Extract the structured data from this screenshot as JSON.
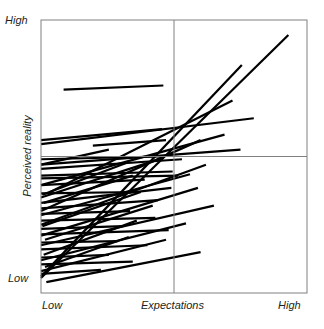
{
  "chart_data": {
    "type": "scatter",
    "title": "",
    "subtitle": "",
    "xlabel": "Expectations",
    "ylabel": "Perceived reality",
    "xlim": [
      0,
      1
    ],
    "ylim": [
      0,
      1
    ],
    "grid": false,
    "legend": false,
    "legend_position": "none",
    "xtick_labels": [
      "Low",
      "Expectations",
      "High"
    ],
    "ytick_labels": [
      "High",
      "Low"
    ],
    "x_axis_low_label": "Low",
    "x_axis_mid_label": "Expectations",
    "x_axis_high_label": "High",
    "y_axis_high_label": "High",
    "y_axis_low_label": "Low",
    "midline_x": 0.5,
    "midline_y": 0.5,
    "stroke_color": "#000000",
    "frame_color": "#808080",
    "midline_color": "#808080",
    "background_color": "#ffffff",
    "stroke_width": 2.2,
    "annotations": [],
    "segment_count": 42,
    "segments": [
      {
        "id": 1,
        "x1": 0.0,
        "y1": 0.055,
        "x2": 0.93,
        "y2": 0.945
      },
      {
        "id": 2,
        "x1": 0.0,
        "y1": 0.06,
        "x2": 0.755,
        "y2": 0.835
      },
      {
        "id": 3,
        "x1": 0.085,
        "y1": 0.745,
        "x2": 0.46,
        "y2": 0.76
      },
      {
        "id": 4,
        "x1": 0.0,
        "y1": 0.56,
        "x2": 0.455,
        "y2": 0.6
      },
      {
        "id": 5,
        "x1": 0.0,
        "y1": 0.49,
        "x2": 0.445,
        "y2": 0.5
      },
      {
        "id": 6,
        "x1": 0.035,
        "y1": 0.37,
        "x2": 0.72,
        "y2": 0.705
      },
      {
        "id": 7,
        "x1": 0.0,
        "y1": 0.395,
        "x2": 0.69,
        "y2": 0.58
      },
      {
        "id": 8,
        "x1": 0.0,
        "y1": 0.43,
        "x2": 0.495,
        "y2": 0.445
      },
      {
        "id": 9,
        "x1": 0.195,
        "y1": 0.54,
        "x2": 0.47,
        "y2": 0.56
      },
      {
        "id": 10,
        "x1": 0.0,
        "y1": 0.35,
        "x2": 0.46,
        "y2": 0.495
      },
      {
        "id": 11,
        "x1": 0.0,
        "y1": 0.455,
        "x2": 0.53,
        "y2": 0.49
      },
      {
        "id": 12,
        "x1": 0.0,
        "y1": 0.42,
        "x2": 0.515,
        "y2": 0.43
      },
      {
        "id": 13,
        "x1": 0.0,
        "y1": 0.47,
        "x2": 0.255,
        "y2": 0.525
      },
      {
        "id": 14,
        "x1": 0.0,
        "y1": 0.3,
        "x2": 0.6,
        "y2": 0.56
      },
      {
        "id": 15,
        "x1": 0.01,
        "y1": 0.33,
        "x2": 0.345,
        "y2": 0.43
      },
      {
        "id": 16,
        "x1": 0.0,
        "y1": 0.395,
        "x2": 0.39,
        "y2": 0.415
      },
      {
        "id": 17,
        "x1": 0.005,
        "y1": 0.36,
        "x2": 0.33,
        "y2": 0.48
      },
      {
        "id": 18,
        "x1": 0.0,
        "y1": 0.33,
        "x2": 0.49,
        "y2": 0.385
      },
      {
        "id": 19,
        "x1": 0.0,
        "y1": 0.285,
        "x2": 0.56,
        "y2": 0.435
      },
      {
        "id": 20,
        "x1": 0.0,
        "y1": 0.365,
        "x2": 0.36,
        "y2": 0.37
      },
      {
        "id": 21,
        "x1": 0.0,
        "y1": 0.25,
        "x2": 0.62,
        "y2": 0.47
      },
      {
        "id": 22,
        "x1": 0.0,
        "y1": 0.31,
        "x2": 0.44,
        "y2": 0.34
      },
      {
        "id": 23,
        "x1": 0.005,
        "y1": 0.245,
        "x2": 0.375,
        "y2": 0.37
      },
      {
        "id": 24,
        "x1": 0.0,
        "y1": 0.29,
        "x2": 0.335,
        "y2": 0.3
      },
      {
        "id": 25,
        "x1": 0.0,
        "y1": 0.21,
        "x2": 0.59,
        "y2": 0.385
      },
      {
        "id": 26,
        "x1": 0.0,
        "y1": 0.265,
        "x2": 0.43,
        "y2": 0.275
      },
      {
        "id": 27,
        "x1": 0.015,
        "y1": 0.195,
        "x2": 0.42,
        "y2": 0.32
      },
      {
        "id": 28,
        "x1": 0.0,
        "y1": 0.235,
        "x2": 0.31,
        "y2": 0.245
      },
      {
        "id": 29,
        "x1": 0.0,
        "y1": 0.175,
        "x2": 0.65,
        "y2": 0.32
      },
      {
        "id": 30,
        "x1": 0.0,
        "y1": 0.215,
        "x2": 0.48,
        "y2": 0.23
      },
      {
        "id": 31,
        "x1": 0.01,
        "y1": 0.14,
        "x2": 0.36,
        "y2": 0.265
      },
      {
        "id": 32,
        "x1": 0.0,
        "y1": 0.185,
        "x2": 0.29,
        "y2": 0.19
      },
      {
        "id": 33,
        "x1": 0.0,
        "y1": 0.12,
        "x2": 0.545,
        "y2": 0.255
      },
      {
        "id": 34,
        "x1": 0.0,
        "y1": 0.16,
        "x2": 0.4,
        "y2": 0.175
      },
      {
        "id": 35,
        "x1": 0.015,
        "y1": 0.095,
        "x2": 0.33,
        "y2": 0.205
      },
      {
        "id": 36,
        "x1": 0.0,
        "y1": 0.13,
        "x2": 0.255,
        "y2": 0.14
      },
      {
        "id": 37,
        "x1": 0.0,
        "y1": 0.08,
        "x2": 0.47,
        "y2": 0.195
      },
      {
        "id": 38,
        "x1": 0.0,
        "y1": 0.105,
        "x2": 0.345,
        "y2": 0.115
      },
      {
        "id": 39,
        "x1": 0.02,
        "y1": 0.04,
        "x2": 0.6,
        "y2": 0.15
      },
      {
        "id": 40,
        "x1": 0.0,
        "y1": 0.07,
        "x2": 0.225,
        "y2": 0.085
      },
      {
        "id": 41,
        "x1": 0.0,
        "y1": 0.47,
        "x2": 0.75,
        "y2": 0.525
      },
      {
        "id": 42,
        "x1": 0.0,
        "y1": 0.545,
        "x2": 0.8,
        "y2": 0.64
      }
    ]
  }
}
